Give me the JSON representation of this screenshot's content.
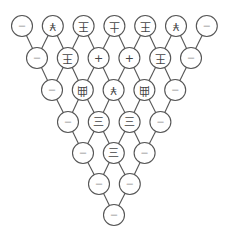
{
  "diagram": {
    "title": "",
    "layout": {
      "row_y": [
        26,
        58,
        90,
        122,
        153,
        184,
        215
      ],
      "row_x_start": [
        22,
        37,
        52,
        68,
        83,
        99,
        114
      ],
      "spacing": 30.8,
      "radius": 10.5
    },
    "rows": [
      {
        "nodes": [
          {
            "glyph": "—",
            "style": "small",
            "rotate": 0
          },
          {
            "glyph": "¥",
            "style": "big",
            "rotate": 180
          },
          {
            "glyph": "王",
            "style": "big",
            "rotate": 180
          },
          {
            "glyph": "土",
            "style": "big",
            "rotate": 180
          },
          {
            "glyph": "王",
            "style": "big",
            "rotate": 180
          },
          {
            "glyph": "¥",
            "style": "big",
            "rotate": 180
          },
          {
            "glyph": "—",
            "style": "small",
            "rotate": 0
          }
        ]
      },
      {
        "nodes": [
          {
            "glyph": "—",
            "style": "small",
            "rotate": 0
          },
          {
            "glyph": "王",
            "style": "big",
            "rotate": 180
          },
          {
            "glyph": "+",
            "style": "big",
            "rotate": 0
          },
          {
            "glyph": "+",
            "style": "big",
            "rotate": 0
          },
          {
            "glyph": "王",
            "style": "big",
            "rotate": 180
          },
          {
            "glyph": "—",
            "style": "small",
            "rotate": 0
          }
        ]
      },
      {
        "nodes": [
          {
            "glyph": "—",
            "style": "small",
            "rotate": 0
          },
          {
            "glyph": "曲",
            "style": "big",
            "rotate": 180
          },
          {
            "glyph": "¥",
            "style": "big",
            "rotate": 180
          },
          {
            "glyph": "曲",
            "style": "big",
            "rotate": 180
          },
          {
            "glyph": "—",
            "style": "small",
            "rotate": 0
          }
        ]
      },
      {
        "nodes": [
          {
            "glyph": "—",
            "style": "small",
            "rotate": 0
          },
          {
            "glyph": "三",
            "style": "big",
            "rotate": 0
          },
          {
            "glyph": "三",
            "style": "big",
            "rotate": 0
          },
          {
            "glyph": "—",
            "style": "small",
            "rotate": 0
          }
        ]
      },
      {
        "nodes": [
          {
            "glyph": "—",
            "style": "small",
            "rotate": 0
          },
          {
            "glyph": "三",
            "style": "big",
            "rotate": 0
          },
          {
            "glyph": "—",
            "style": "small",
            "rotate": 0
          }
        ]
      },
      {
        "nodes": [
          {
            "glyph": "—",
            "style": "small",
            "rotate": 0
          },
          {
            "glyph": "—",
            "style": "small",
            "rotate": 0
          }
        ]
      },
      {
        "nodes": [
          {
            "glyph": "—",
            "style": "small",
            "rotate": 0
          }
        ]
      }
    ],
    "colors": {
      "stroke": "#555555",
      "fill": "#ffffff",
      "glyph": "#444444"
    }
  }
}
